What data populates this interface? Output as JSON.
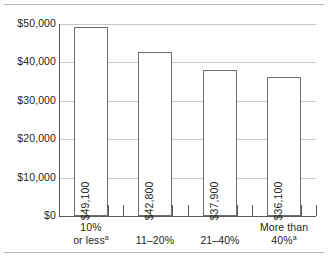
{
  "chart_data": {
    "type": "bar",
    "title": "",
    "subtitle": "",
    "xlabel": "",
    "ylabel": "",
    "categories": [
      "10% or less",
      "11–20%",
      "21–40%",
      "More than 40%"
    ],
    "category_lines": [
      [
        "10%",
        "or less"
      ],
      [
        "11–20%"
      ],
      [
        "21–40%"
      ],
      [
        "More than",
        "40%"
      ]
    ],
    "category_footnotes": [
      "a",
      "",
      "",
      "a"
    ],
    "values": [
      49100,
      42800,
      37900,
      36100
    ],
    "value_labels": [
      "$49,100",
      "$42,800",
      "$37,900",
      "$36,100"
    ],
    "ylim": [
      0,
      50000
    ],
    "ytick_values": [
      50000,
      40000,
      30000,
      20000,
      10000,
      0
    ],
    "ytick_labels": [
      "$50,000",
      "$40,000",
      "$30,000",
      "$20,000",
      "$10,000",
      "$0"
    ],
    "grid": true,
    "legend": null,
    "colors": {
      "bar_fill": "#ffffff",
      "bar_stroke": "#6d6e71",
      "gridline": "#c8c8c8",
      "axis": "#58595b",
      "text": "#231f20",
      "rule": "#b9b9b9"
    }
  }
}
